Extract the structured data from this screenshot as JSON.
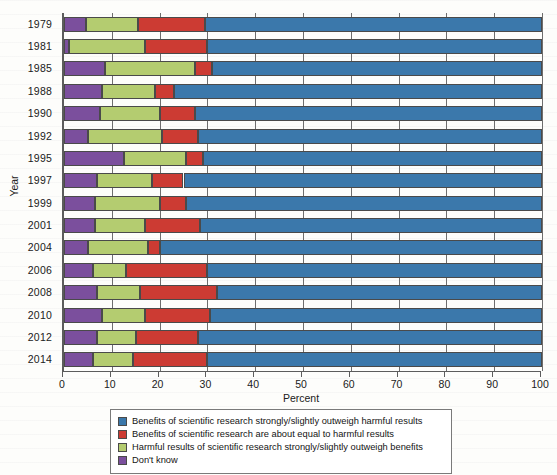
{
  "chart_data": {
    "type": "bar",
    "orientation": "horizontal",
    "stacked": true,
    "stack_mode": "percent",
    "title": "",
    "xlabel": "Percent",
    "ylabel": "Year",
    "xlim": [
      0,
      100
    ],
    "xticks": [
      0,
      10,
      20,
      30,
      40,
      50,
      60,
      70,
      80,
      90,
      100
    ],
    "xtick_labels": [
      "0",
      "10",
      "20",
      "30",
      "40",
      "50",
      "60",
      "70",
      "80",
      "90",
      "100"
    ],
    "grid": true,
    "grid_axis": "x",
    "legend_position": "bottom",
    "categories": [
      "1979",
      "1981",
      "1985",
      "1988",
      "1990",
      "1992",
      "1995",
      "1997",
      "1999",
      "2001",
      "2004",
      "2006",
      "2008",
      "2010",
      "2012",
      "2014"
    ],
    "series": [
      {
        "name": "Don't know",
        "color": "#7b4f9d",
        "values": [
          4.5,
          1.0,
          8.5,
          8.0,
          7.5,
          5.0,
          12.5,
          7.0,
          6.5,
          6.5,
          5.0,
          6.0,
          7.0,
          8.0,
          7.0,
          6.0
        ]
      },
      {
        "name": "Harmful results of scientific research strongly/slightly outweigh benefits",
        "color": "#b4cc70",
        "values": [
          11.0,
          16.0,
          19.0,
          11.0,
          12.5,
          15.5,
          13.0,
          11.5,
          13.5,
          10.5,
          12.5,
          7.0,
          9.0,
          9.0,
          8.0,
          8.5
        ]
      },
      {
        "name": "Benefits of scientific research are about equal to harmful results",
        "color": "#cc3b33",
        "values": [
          14.0,
          13.0,
          3.5,
          4.0,
          7.5,
          7.5,
          3.5,
          6.5,
          5.5,
          11.5,
          2.5,
          17.0,
          16.0,
          13.5,
          13.0,
          15.5
        ]
      },
      {
        "name": "Benefits of scientific research strongly/slightly outweigh harmful results",
        "color": "#3b78ab",
        "values": [
          70.5,
          70.0,
          69.0,
          77.0,
          72.5,
          72.0,
          71.0,
          75.0,
          74.5,
          71.5,
          80.0,
          70.0,
          68.0,
          69.5,
          72.0,
          70.0
        ]
      }
    ],
    "legend_entries": [
      {
        "label": "Benefits of scientific research strongly/slightly outweigh harmful results",
        "color": "#3b78ab"
      },
      {
        "label": "Benefits of scientific research are about equal to harmful results",
        "color": "#cc3b33"
      },
      {
        "label": "Harmful results of scientific research strongly/slightly outweigh benefits",
        "color": "#b4cc70"
      },
      {
        "label": "Don't know",
        "color": "#7b4f9d"
      }
    ]
  }
}
